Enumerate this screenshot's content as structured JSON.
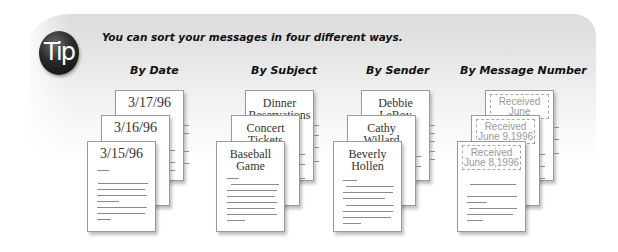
{
  "tip": {
    "badge_label": "Tip",
    "title": "You can sort your messages in four different ways."
  },
  "colors": {
    "badge": "#111111",
    "banner": "#dcdcdc",
    "text": "#111111",
    "doc_text": "#333333",
    "stamp_text": "#9a9a9a"
  },
  "columns": [
    {
      "heading": "By Date",
      "docs": [
        {
          "label": "3/17/96"
        },
        {
          "label": "3/16/96"
        },
        {
          "label": "3/15/96"
        }
      ]
    },
    {
      "heading": "By Subject",
      "docs": [
        {
          "label_line1": "Dinner",
          "label_line2": "Reservations"
        },
        {
          "label_line1": "Concert",
          "label_line2": "Tickets"
        },
        {
          "label_line1": "Baseball",
          "label_line2": "Game"
        }
      ]
    },
    {
      "heading": "By Sender",
      "docs": [
        {
          "label_line1": "Debbie",
          "label_line2": "LeRoy"
        },
        {
          "label_line1": "Cathy",
          "label_line2": "Willard"
        },
        {
          "label_line1": "Beverly",
          "label_line2": "Hollen"
        }
      ]
    },
    {
      "heading": "By Message Number",
      "docs": [
        {
          "stamp_line1": "Received",
          "stamp_line2": "June 10,1996"
        },
        {
          "stamp_line1": "Received",
          "stamp_line2": "June 9,1996"
        },
        {
          "stamp_line1": "Received",
          "stamp_line2": "June 8,1996"
        }
      ]
    }
  ]
}
